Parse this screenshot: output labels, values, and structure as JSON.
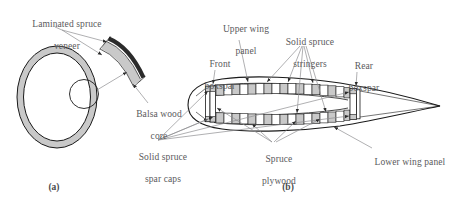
{
  "figure": {
    "title_a": "(a)",
    "title_b": "(b)",
    "panel_a_name": "laminated-spruce-ring-detail",
    "panel_b_name": "wing-airfoil-cross-section"
  },
  "colors": {
    "stroke": "#1a1a1a",
    "fill_gray": "#c9c9c9",
    "fill_dark": "#2b2b2b",
    "text": "#5a5a5c",
    "leader": "#8e8e90",
    "background": "#ffffff"
  },
  "panel_a": {
    "labels": [
      {
        "id": "laminated-spruce-veneer",
        "line1": "Laminated spruce",
        "line2": "veneer"
      },
      {
        "id": "balsa-wood-core",
        "line1": "Balsa wood",
        "line2": "core"
      }
    ],
    "caption": "(a)"
  },
  "panel_b": {
    "labels": [
      {
        "id": "upper-wing-panel",
        "line1": "Upper wing",
        "line2": "panel"
      },
      {
        "id": "solid-spruce-stringers",
        "line1": "Solid spruce",
        "line2": "stringers"
      },
      {
        "id": "front-boxspar",
        "line1": "Front",
        "line2": "boxspar"
      },
      {
        "id": "rear-boxspar",
        "line1": "Rear",
        "line2": "boxspar"
      },
      {
        "id": "solid-spruce-spar-caps",
        "line1": "Solid spruce",
        "line2": "spar caps"
      },
      {
        "id": "spruce-plywood",
        "line1": "Spruce",
        "line2": "plywood"
      },
      {
        "id": "lower-wing-panel",
        "line1": "Lower wing panel",
        "line2": ""
      }
    ],
    "caption": "(b)"
  },
  "diagram_data": {
    "type": "technical-cross-section",
    "subject": "Wooden aircraft wing construction",
    "panel_a_elements": [
      "oval ring cross-section",
      "magnifier circle",
      "curved laminate sandwich segment"
    ],
    "panel_b_elements": [
      "airfoil outline",
      "front boxspar",
      "rear boxspar",
      "upper wing panel stringers",
      "lower wing panel stringers",
      "spruce plywood webs",
      "solid spruce spar caps"
    ],
    "upper_stringer_count": 16,
    "lower_stringer_count": 16
  }
}
